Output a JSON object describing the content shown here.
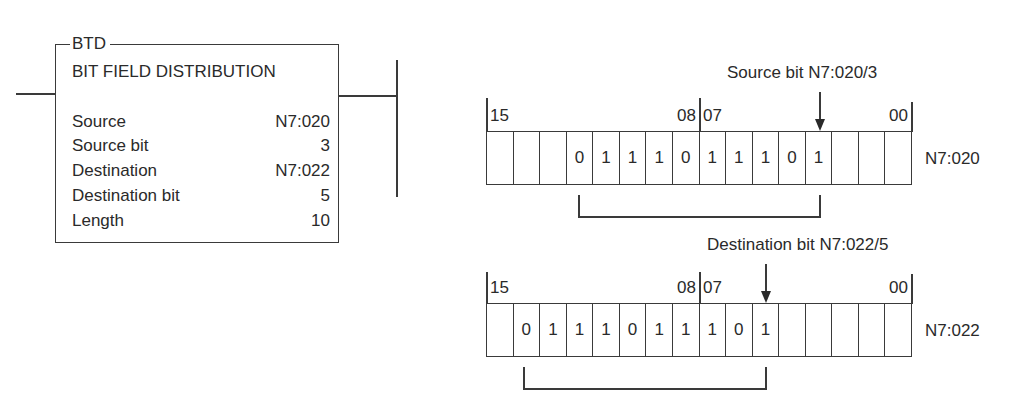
{
  "instruction": {
    "mnemonic": "BTD",
    "title": "BIT FIELD DISTRIBUTION",
    "params": [
      {
        "label": "Source",
        "value": "N7:020"
      },
      {
        "label": "Source bit",
        "value": "3"
      },
      {
        "label": "Destination",
        "value": "N7:022"
      },
      {
        "label": "Destination bit",
        "value": "5"
      },
      {
        "label": "Length",
        "value": "10"
      }
    ]
  },
  "source_register": {
    "name": "N7:020",
    "callout": "Source bit N7:020/3",
    "bit_labels": {
      "high": "15",
      "mid_high": "08",
      "mid_low": "07",
      "low": "00"
    },
    "cells": [
      "",
      "",
      "",
      "0",
      "1",
      "1",
      "1",
      "0",
      "1",
      "1",
      "1",
      "0",
      "1",
      "",
      "",
      ""
    ]
  },
  "destination_register": {
    "name": "N7:022",
    "callout": "Destination bit N7:022/5",
    "bit_labels": {
      "high": "15",
      "mid_high": "08",
      "mid_low": "07",
      "low": "00"
    },
    "cells": [
      "",
      "0",
      "1",
      "1",
      "1",
      "0",
      "1",
      "1",
      "1",
      "0",
      "1",
      "",
      "",
      "",
      "",
      ""
    ]
  }
}
